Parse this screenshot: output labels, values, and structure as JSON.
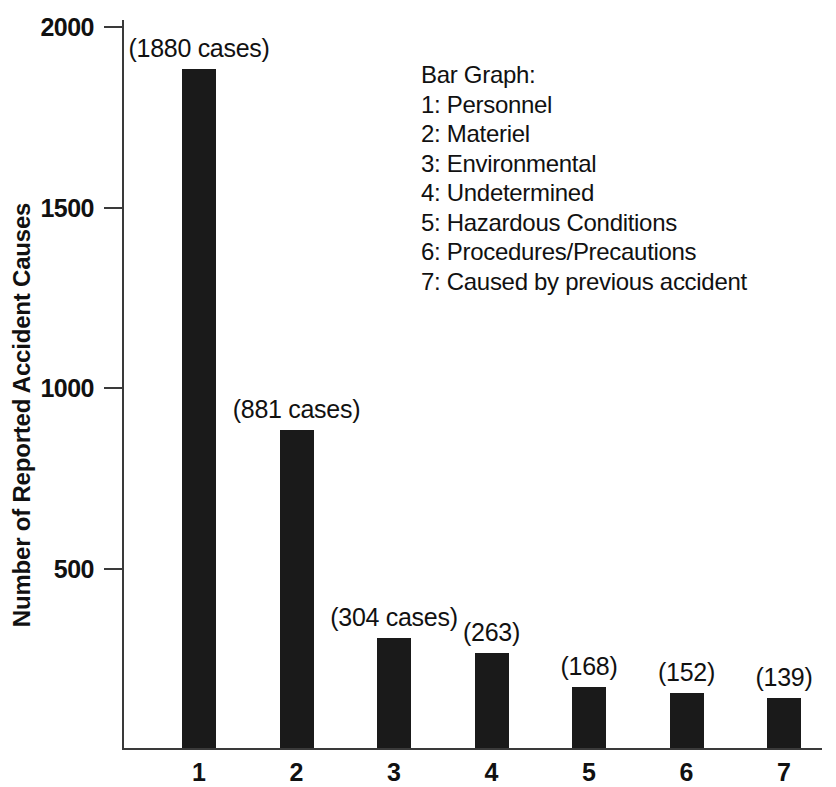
{
  "chart_data": {
    "type": "bar",
    "title": "",
    "xlabel": "",
    "ylabel": "Number of Reported Accident Causes",
    "categories": [
      "1",
      "2",
      "3",
      "4",
      "5",
      "6",
      "7"
    ],
    "values": [
      1880,
      881,
      304,
      263,
      168,
      152,
      139
    ],
    "point_labels": [
      "(1880 cases)",
      "(881 cases)",
      "(304 cases)",
      "(263)",
      "(168)",
      "(152)",
      "(139)"
    ],
    "ylim": [
      0,
      2000
    ],
    "yticks": [
      500,
      1000,
      1500,
      2000
    ],
    "ytick_labels": [
      "500",
      "1000",
      "1500",
      "2000"
    ],
    "grid": false,
    "legend_position": "upper-right",
    "bar_color": "#1a1a1a",
    "axis_color": "#3a3a3a",
    "legend": {
      "heading": "Bar Graph:",
      "entries": [
        "1: Personnel",
        "2: Materiel",
        "3: Environmental",
        "4: Undetermined",
        "5: Hazardous Conditions",
        "6: Procedures/Precautions",
        "7: Caused by previous accident"
      ]
    }
  }
}
